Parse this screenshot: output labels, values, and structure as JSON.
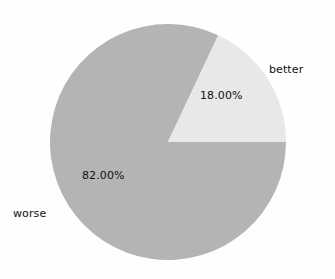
{
  "chart_data": {
    "type": "pie",
    "title": "",
    "categories": [
      "better",
      "worse"
    ],
    "values": [
      18.0,
      82.0
    ],
    "value_labels": [
      "18.00%",
      "82.00%"
    ],
    "units": "percent",
    "slice_colors": [
      "#e8e8e8",
      "#b4b4b4"
    ],
    "start_angle_deg": 0,
    "direction": "counterclockwise",
    "legend": "none",
    "grid": false,
    "background_color": "#fefefe",
    "text_color": "#101010",
    "slices": [
      {
        "name": "better",
        "value": 18.0,
        "value_label": "18.00%",
        "color": "#e8e8e8",
        "label_position": "outside-right"
      },
      {
        "name": "worse",
        "value": 82.0,
        "value_label": "82.00%",
        "color": "#b4b4b4",
        "label_position": "outside-left"
      }
    ]
  },
  "labels": {
    "better": "better",
    "worse": "worse",
    "pct_better": "18.00%",
    "pct_worse": "82.00%"
  }
}
